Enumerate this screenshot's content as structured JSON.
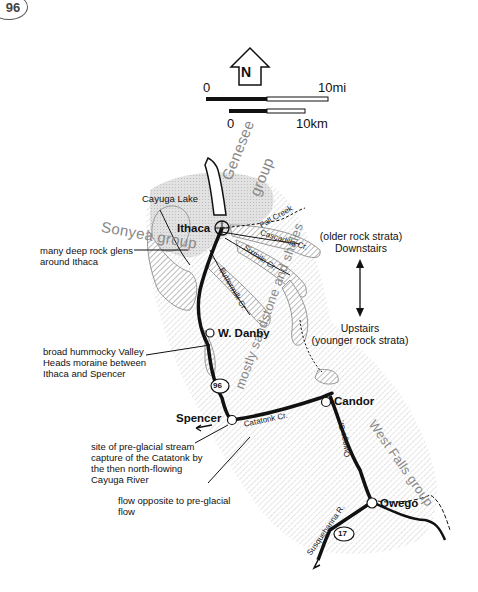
{
  "page": {
    "number": "96"
  },
  "compass": {
    "label": "N"
  },
  "scale_bars": {
    "miles": {
      "start": "0",
      "end": "10",
      "unit": "mi"
    },
    "kilometers": {
      "start": "0",
      "end": "10",
      "unit": "km"
    }
  },
  "towns": {
    "ithaca": "Ithaca",
    "w_danby": "W. Danby",
    "spencer": "Spencer",
    "candor": "Candor",
    "owego": "Owego"
  },
  "water": {
    "cayuga_lake": "Cayuga Lake",
    "fall_creek": "Fall Creek",
    "cascadilla": "Cascadilla Cr.",
    "sixmile": "Sixmile Cr.",
    "buttermilk": "Buttermilk Cr.",
    "catatonk": "Catatonk Cr.",
    "owego_cr": "Owego Cr.",
    "susquehanna": "Susquehanna R."
  },
  "geology": {
    "genesee": "Genesee group",
    "genesee_line1": "Genesee",
    "genesee_line2": "group",
    "sonyea": "Sonyea group",
    "sandstone": "mostly sandstone and shales",
    "west_falls": "West Falls group"
  },
  "routes": {
    "ny96": "96",
    "ny17": "17"
  },
  "strata_legend": {
    "top_line1": "(older rock strata)",
    "top_line2": "Downstairs",
    "bottom_line1": "Upstairs",
    "bottom_line2": "(younger rock strata)"
  },
  "callouts": {
    "glens": [
      "many deep rock glens",
      "around Ithaca"
    ],
    "moraine": [
      "broad hummocky Valley",
      "Heads moraine between",
      "Ithaca and Spencer"
    ],
    "capture": [
      "site of pre-glacial stream",
      "capture of the Catatonk by",
      "the then north-flowing",
      "Cayuga River"
    ],
    "flow": [
      "flow opposite to pre-glacial",
      "flow"
    ]
  },
  "colors": {
    "ink": "#111111",
    "gray_label": "#888888",
    "stipple": "#bdbdbd",
    "hatch": "#9a9a9a",
    "light_fill": "#d8d8d8"
  }
}
